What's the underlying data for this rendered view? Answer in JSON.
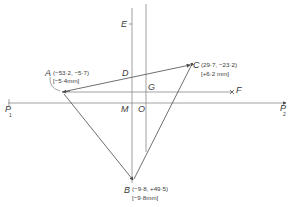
{
  "diagram": {
    "type": "geometric construction",
    "colors": {
      "line": "#7a7a7a",
      "text": "#3a3a3a",
      "background": "#ffffff"
    },
    "points": {
      "A": {
        "label": "A",
        "coords": "(−53·2, −5·7)",
        "offset": "[−5·4mm]"
      },
      "B": {
        "label": "B",
        "coords": "(−9·8, +49·5)",
        "offset": "[−9·8mm]"
      },
      "C": {
        "label": "C",
        "coords": "(29·7, −23·2)",
        "offset": "[+6·2 mm]"
      },
      "D": {
        "label": "D"
      },
      "E": {
        "label": "E"
      },
      "F": {
        "label": "F"
      },
      "G": {
        "label": "G"
      },
      "M": {
        "label": "M"
      },
      "O": {
        "label": "O"
      },
      "P1": {
        "label": "P",
        "subscript": "1"
      },
      "P2": {
        "label": "P",
        "subscript": "2"
      }
    }
  }
}
